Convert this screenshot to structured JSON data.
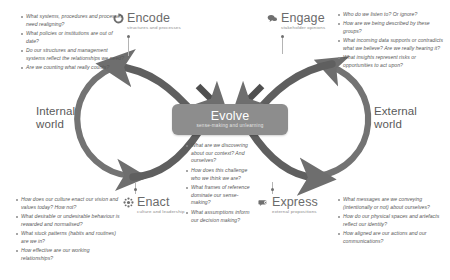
{
  "diagram": {
    "center": {
      "title": "Evolve",
      "subtitle": "sense-making and unlearning"
    },
    "worlds": {
      "internal": "Internal\nworld",
      "internal_line1": "Internal",
      "internal_line2": "world",
      "external_line1": "External",
      "external_line2": "world"
    },
    "nodes": [
      {
        "id": "encode",
        "title": "Encode",
        "subtitle": "structures and processes",
        "icon": "gear-recycle-icon"
      },
      {
        "id": "engage",
        "title": "Engage",
        "subtitle": "stakeholder opinions",
        "icon": "speech-cloud-icon"
      },
      {
        "id": "enact",
        "title": "Enact",
        "subtitle": "culture and leadership",
        "icon": "network-nodes-icon"
      },
      {
        "id": "express",
        "title": "Express",
        "subtitle": "external propositions",
        "icon": "megaphone-bubble-icon"
      }
    ],
    "questions": {
      "encode": [
        "What systems, procedures and processes need realigning?",
        "What policies or institutions are out of date?",
        "Do our structures and management systems reflect the relationships we need?",
        "Are we counting what really counts?"
      ],
      "engage": [
        "Who do we listen to? Or ignore?",
        "How are we being described by these groups?",
        "What incoming data supports or contradicts what we believe? Are we really hearing it?",
        "What insights represent risks or opportunities to act upon?"
      ],
      "enact": [
        "How does our culture enact our vision and values today? How not?",
        "What desirable or undesirable behaviour is rewarded and normalised?",
        "What stuck patterns (habits and routines) are we in?",
        "How effective are our working relationships?"
      ],
      "express": [
        "What messages are we conveying (intentionally or not) about ourselves?",
        "How do our physical spaces and artefacts reflect our identity?",
        "How aligned are our actions and our communications?"
      ],
      "evolve": [
        "What are we discovering about our context? And ourselves?",
        "How does this challenge who we think we are?",
        "What frames of reference dominate our sense-making?",
        "What assumptions inform our decision making?"
      ]
    },
    "colors": {
      "loop_stroke": "#6e6e6e",
      "loop_stroke_light": "#9a9a9a",
      "center_card": "#8d8d8d",
      "text": "#575757",
      "heading": "#6b6b6b"
    }
  }
}
